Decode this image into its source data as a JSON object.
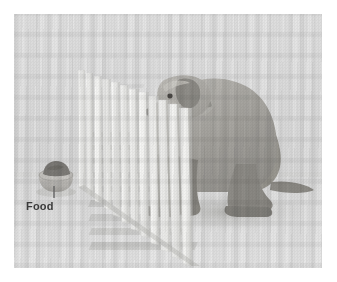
{
  "figure": {
    "caption_label": "Food",
    "dimensions": {
      "width": 337,
      "height": 282
    }
  },
  "photo": {
    "border_left": 14,
    "border_top": 14,
    "width": 308,
    "height": 254,
    "background_color": "#e3e3e3",
    "floor_color": "#e5e5e5",
    "wall_color": "#e1e1e1"
  },
  "annotations": [
    {
      "id": "food-annotation",
      "label": "Food",
      "text_color": "#3b3b3b",
      "leader_line_color": "#6a6a6a",
      "points_to": "food-bowl"
    }
  ],
  "objects": {
    "food_bowl": {
      "name": "food bowl",
      "bowl_color": "#b9b7b3",
      "food_color": "#7d7b77",
      "left": 40,
      "top": 166,
      "width": 32,
      "height": 24
    },
    "fence": {
      "name": "picket fence",
      "slat_count": 13,
      "slat_color": "#f2f2f0",
      "shadow_color": "#c9c9c7"
    },
    "dog": {
      "name": "sitting dog",
      "breed_appearance": "labrador retriever",
      "posture": "sitting, facing fence",
      "body_color": "#a8a6a2",
      "shadow_color": "#bdbdba"
    }
  },
  "colors": {
    "paper": "#ffffff",
    "ink": "#3b3b3b",
    "photo_light": "#e8e8e8",
    "photo_mid": "#c8c8c6",
    "photo_dark": "#8e8c88"
  }
}
